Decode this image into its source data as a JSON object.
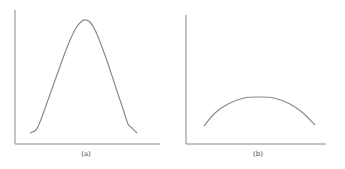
{
  "panels": [
    {
      "id": "a",
      "caption": "(a)",
      "description": "Tall, narrow bell-shaped curve",
      "axes": {
        "origin": [
          15,
          144
        ],
        "x_end": 160,
        "y_top": 10
      },
      "curve_points": [
        [
          30,
          133
        ],
        [
          36,
          130
        ],
        [
          40,
          122
        ],
        [
          48,
          100
        ],
        [
          58,
          72
        ],
        [
          68,
          45
        ],
        [
          76,
          28
        ],
        [
          82,
          21
        ],
        [
          86,
          20
        ],
        [
          90,
          22
        ],
        [
          96,
          32
        ],
        [
          106,
          58
        ],
        [
          116,
          88
        ],
        [
          124,
          112
        ],
        [
          128,
          124
        ],
        [
          132,
          128
        ],
        [
          137,
          133
        ]
      ],
      "label_pos": [
        86,
        150
      ]
    },
    {
      "id": "b",
      "caption": "(b)",
      "description": "Low, wide flat arc",
      "axes": {
        "origin": [
          186,
          144
        ],
        "x_end": 326,
        "y_top": 15
      },
      "curve_points": [
        [
          204,
          126
        ],
        [
          215,
          113
        ],
        [
          228,
          104
        ],
        [
          244,
          98
        ],
        [
          259,
          97
        ],
        [
          274,
          98
        ],
        [
          290,
          104
        ],
        [
          303,
          113
        ],
        [
          315,
          125
        ]
      ],
      "label_pos": [
        258,
        150
      ]
    }
  ],
  "colors": {
    "axis": "#888888",
    "curve": "#8a8a8a",
    "caption": "#444444"
  }
}
